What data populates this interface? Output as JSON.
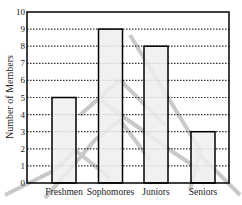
{
  "chart_data": {
    "type": "bar",
    "title": "",
    "xlabel": "",
    "ylabel": "Number of Members",
    "categories": [
      "Freshmen",
      "Sophomores",
      "Juniors",
      "Seniors"
    ],
    "values": [
      5,
      9,
      8,
      3
    ],
    "ylim": [
      0,
      10
    ],
    "yticks": [
      0,
      1,
      2,
      3,
      4,
      5,
      6,
      7,
      8,
      9,
      10
    ],
    "grid": {
      "y": true,
      "style": "dotted"
    },
    "legend": null,
    "colors": {
      "bar_fill": "#eeeeee",
      "bar_stroke": "#000000",
      "grid": "#333333",
      "watermark": "#b0b0b0"
    }
  }
}
